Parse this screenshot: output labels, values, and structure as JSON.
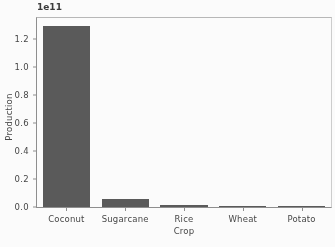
{
  "figure": {
    "background_color": "#ffffff",
    "bar_color": "#595959",
    "axis_color": "#8e8e8e",
    "text_color": "#454545",
    "width": 335,
    "height": 247
  },
  "chart_data": {
    "type": "bar",
    "title": "",
    "subtitle": "",
    "xlabel": "Crop",
    "ylabel": "Production",
    "categories": [
      "Coconut",
      "Sugarcane",
      "Rice",
      "Wheat",
      "Potato"
    ],
    "values": [
      129000000000,
      6000000000,
      1200000000,
      900000000,
      400000000
    ],
    "values_scaled": [
      1.29,
      0.06,
      0.012,
      0.009,
      0.004
    ],
    "y_offset_text": "1e11",
    "y_offset_multiplier": 100000000000,
    "ylim": [
      0.0,
      1.35
    ],
    "ylim_scaled_max": 1.35,
    "yticks": [
      0.0,
      0.2,
      0.4,
      0.6,
      0.8,
      1.0,
      1.2
    ],
    "ytick_labels": [
      "0.0",
      "0.2",
      "0.4",
      "0.6",
      "0.8",
      "1.0",
      "1.2"
    ],
    "grid": false,
    "legend": null,
    "legend_position": "none",
    "bar_width_fraction": 0.8,
    "annotations": []
  }
}
